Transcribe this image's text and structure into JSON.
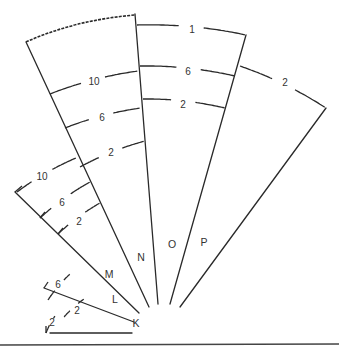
{
  "diagram": {
    "type": "nested-sector-fan",
    "sectors": [
      {
        "id": "K",
        "label": "K",
        "arcs": [
          {
            "label": "2"
          }
        ]
      },
      {
        "id": "L",
        "label": "L",
        "arcs": [
          {
            "label": "2"
          },
          {
            "label": "6"
          }
        ]
      },
      {
        "id": "M",
        "label": "M",
        "arcs": [
          {
            "label": "2"
          },
          {
            "label": "6"
          },
          {
            "label": "10"
          }
        ]
      },
      {
        "id": "N",
        "label": "N",
        "arcs": [
          {
            "label": "2"
          },
          {
            "label": "6"
          },
          {
            "label": "10"
          }
        ],
        "outer_boundary": "dashed"
      },
      {
        "id": "O",
        "label": "O",
        "arcs": [
          {
            "label": "2"
          },
          {
            "label": "6"
          },
          {
            "label": "1"
          }
        ]
      },
      {
        "id": "P",
        "label": "P",
        "arcs": [
          {
            "label": "2"
          }
        ]
      }
    ]
  }
}
